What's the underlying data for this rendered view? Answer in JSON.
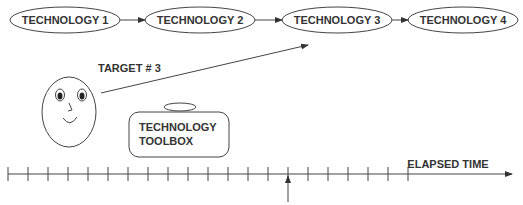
{
  "diagram": {
    "technologies": [
      {
        "label": "TECHNOLOGY 1",
        "cx": 65,
        "cy": 20,
        "rx": 55,
        "ry": 13
      },
      {
        "label": "TECHNOLOGY 2",
        "cx": 200,
        "cy": 20,
        "rx": 55,
        "ry": 13
      },
      {
        "label": "TECHNOLOGY 3",
        "cx": 337,
        "cy": 20,
        "rx": 55,
        "ry": 13
      },
      {
        "label": "TECHNOLOGY 4",
        "cx": 462,
        "cy": 20,
        "rx": 55,
        "ry": 13
      }
    ],
    "target_label": "TARGET # 3",
    "toolbox_label_line1": "TECHNOLOGY",
    "toolbox_label_line2": "TOOLBOX",
    "timeline_label": "ELAPSED TIME",
    "timeline": {
      "y": 174,
      "start_x": 8,
      "end_x": 515,
      "tick_spacing": 20,
      "tick_count": 21,
      "marker_tick_index": 14
    },
    "colors": {
      "stroke": "#444444",
      "text": "#333333",
      "background": "#ffffff"
    }
  }
}
